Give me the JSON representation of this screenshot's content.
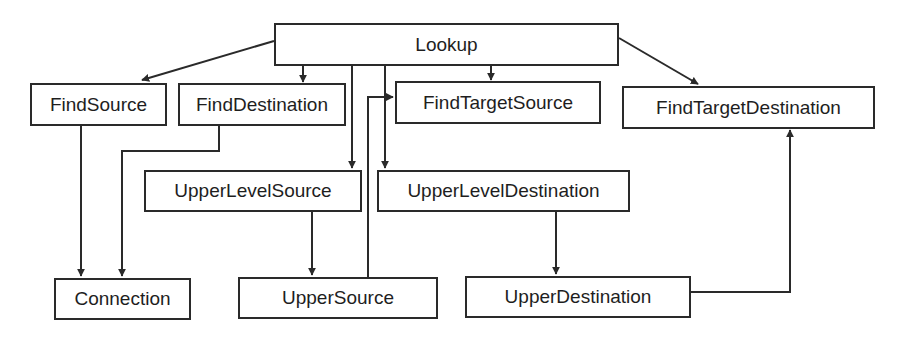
{
  "diagram": {
    "type": "call-graph",
    "nodes": [
      {
        "id": "lookup",
        "label": "Lookup",
        "x": 274,
        "y": 23,
        "w": 345,
        "h": 43
      },
      {
        "id": "find-source",
        "label": "FindSource",
        "x": 30,
        "y": 83,
        "w": 137,
        "h": 43
      },
      {
        "id": "find-destination",
        "label": "FindDestination",
        "x": 178,
        "y": 83,
        "w": 168,
        "h": 43
      },
      {
        "id": "find-target-source",
        "label": "FindTargetSource",
        "x": 395,
        "y": 81,
        "w": 206,
        "h": 43
      },
      {
        "id": "find-target-destination",
        "label": "FindTargetDestination",
        "x": 622,
        "y": 86,
        "w": 253,
        "h": 43
      },
      {
        "id": "upper-level-source",
        "label": "UpperLevelSource",
        "x": 144,
        "y": 170,
        "w": 218,
        "h": 42
      },
      {
        "id": "upper-level-destination",
        "label": "UpperLevelDestination",
        "x": 377,
        "y": 170,
        "w": 253,
        "h": 42
      },
      {
        "id": "connection",
        "label": "Connection",
        "x": 54,
        "y": 278,
        "w": 137,
        "h": 42
      },
      {
        "id": "upper-source",
        "label": "UpperSource",
        "x": 238,
        "y": 277,
        "w": 200,
        "h": 42
      },
      {
        "id": "upper-destination",
        "label": "UpperDestination",
        "x": 465,
        "y": 276,
        "w": 226,
        "h": 42
      }
    ],
    "edges": [
      {
        "from": "lookup",
        "to": "find-source",
        "points": [
          [
            274,
            41
          ],
          [
            142,
            80
          ]
        ]
      },
      {
        "from": "lookup",
        "to": "find-destination",
        "points": [
          [
            303,
            66
          ],
          [
            303,
            82
          ]
        ]
      },
      {
        "from": "lookup",
        "to": "find-target-source",
        "points": [
          [
            491,
            66
          ],
          [
            491,
            80
          ]
        ]
      },
      {
        "from": "lookup",
        "to": "find-target-destination",
        "points": [
          [
            619,
            38
          ],
          [
            698,
            84
          ]
        ]
      },
      {
        "from": "lookup",
        "to": "upper-level-source",
        "points": [
          [
            352,
            66
          ],
          [
            352,
            168
          ]
        ]
      },
      {
        "from": "lookup",
        "to": "upper-level-destination",
        "points": [
          [
            385,
            66
          ],
          [
            385,
            168
          ]
        ]
      },
      {
        "from": "find-source",
        "to": "connection",
        "points": [
          [
            81,
            126
          ],
          [
            81,
            276
          ]
        ]
      },
      {
        "from": "find-destination",
        "to": "connection",
        "points": [
          [
            219,
            126
          ],
          [
            219,
            151
          ],
          [
            122,
            151
          ],
          [
            122,
            276
          ]
        ]
      },
      {
        "from": "upper-level-source",
        "to": "upper-source",
        "points": [
          [
            312,
            212
          ],
          [
            312,
            275
          ]
        ]
      },
      {
        "from": "upper-source",
        "to": "find-target-source",
        "points": [
          [
            368,
            277
          ],
          [
            368,
            97
          ],
          [
            393,
            97
          ]
        ]
      },
      {
        "from": "upper-level-destination",
        "to": "upper-destination",
        "points": [
          [
            556,
            212
          ],
          [
            556,
            274
          ]
        ]
      },
      {
        "from": "upper-destination",
        "to": "find-target-destination",
        "points": [
          [
            691,
            292
          ],
          [
            790,
            292
          ],
          [
            790,
            130
          ]
        ]
      }
    ],
    "colors": {
      "stroke": "#2a2a2a",
      "text": "#1e1e1e",
      "background": "#ffffff"
    }
  }
}
